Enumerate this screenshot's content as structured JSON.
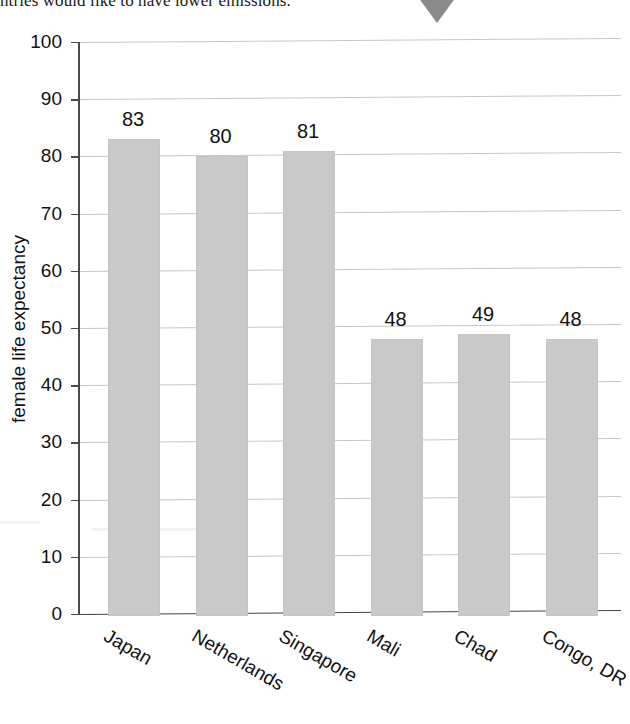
{
  "page": {
    "text_fragment": "ntries would like to have lower emissions.",
    "pointer_icon": "triangle-down-icon"
  },
  "chart_data": {
    "type": "bar",
    "title": "",
    "xlabel": "",
    "ylabel": "female life expectancy",
    "categories": [
      "Japan",
      "Netherlands",
      "Singapore",
      "Mali",
      "Chad",
      "Congo, DR"
    ],
    "values": [
      83,
      80,
      81,
      48,
      49,
      48
    ],
    "value_labels": [
      "83",
      "80",
      "81",
      "48",
      "49",
      "48"
    ],
    "ylim": [
      0,
      100
    ],
    "ytick_labels": [
      "100",
      "90",
      "80",
      "70",
      "60",
      "50",
      "40",
      "30",
      "20",
      "10",
      "0"
    ],
    "ytick_values": [
      100,
      90,
      80,
      70,
      60,
      50,
      40,
      30,
      20,
      10,
      0
    ],
    "ytick_step": 10,
    "grid": true,
    "legend": false,
    "bar_color": "#c9c9c9",
    "grid_color": "#c6c6c6",
    "axis_color": "#4a4a4a",
    "group_gap_after_index": 2
  }
}
